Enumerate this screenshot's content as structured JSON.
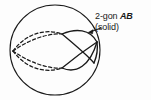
{
  "figure": {
    "background_color": "#fdfdfd",
    "stroke_color": "#1a1a1a",
    "annotation": {
      "line1_prefix": "2-gon ",
      "line1_italic": "AB",
      "line2": "(solid)",
      "full_text": "2-gon AB (solid)",
      "leader_arrow_target": "solid 2-gon arc intersection"
    },
    "sphere": {
      "center_x": 55,
      "center_y": 50,
      "radius": 45,
      "outline_style": "solid"
    },
    "arcs": [
      {
        "name": "back-arc-upper",
        "style": "dashed",
        "hemisphere": "far"
      },
      {
        "name": "back-arc-lower",
        "style": "dashed",
        "hemisphere": "far"
      },
      {
        "name": "back-arc-mid-upper",
        "style": "dashed",
        "hemisphere": "far"
      },
      {
        "name": "back-arc-mid-lower",
        "style": "dashed",
        "hemisphere": "far"
      },
      {
        "name": "front-arc-upper",
        "style": "solid",
        "hemisphere": "near"
      },
      {
        "name": "front-arc-lower",
        "style": "solid",
        "hemisphere": "near"
      },
      {
        "name": "front-arc-mid-upper",
        "style": "solid",
        "hemisphere": "near"
      },
      {
        "name": "front-arc-mid-lower",
        "style": "solid",
        "hemisphere": "near"
      }
    ],
    "vertices": [
      {
        "name": "vertex-A-left",
        "x": 14,
        "y": 52
      },
      {
        "name": "vertex-B-right",
        "x": 97,
        "y": 43
      }
    ]
  }
}
